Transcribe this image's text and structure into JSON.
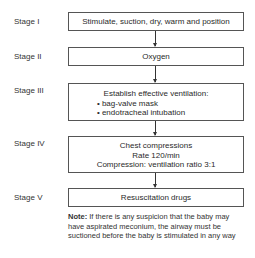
{
  "stages": [
    {
      "label": "Stage I",
      "lines": [
        "Stimulate, suction, dry, warm and position"
      ]
    },
    {
      "label": "Stage II",
      "lines": [
        "Oxygen"
      ]
    },
    {
      "label": "Stage III",
      "heading": "Establish effective ventilation:",
      "bullets": [
        "• bag-valve mask",
        "• endotracheal intubation"
      ]
    },
    {
      "label": "Stage IV",
      "lines": [
        "Chest compressions",
        "Rate 120/min",
        "Compression: ventilation ratio 3:1"
      ]
    },
    {
      "label": "Stage V",
      "lines": [
        "Resuscitation drugs"
      ]
    }
  ],
  "note": {
    "label": "Note:",
    "text": " If there is any suspicion that the baby may have aspirated meconium, the airway must be suctioned before the baby is stimulated in any way"
  }
}
